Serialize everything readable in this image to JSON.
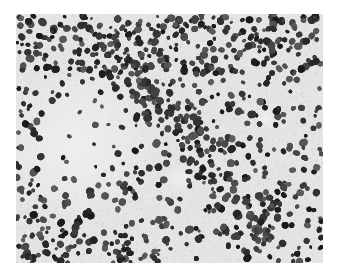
{
  "image": {
    "kind": "grayscale histology micrograph",
    "description": "Tissue section with densely packed dark-stained cell nuclei forming a diagonal band through the center, dense clusters along the bottom edge, a pale sparsely-populated region on the left-middle and a small pale spot at right-center.",
    "colors": {
      "background": "#e4e4e4",
      "pale_region": "#ececec",
      "nuclei": "#2b2b2b"
    },
    "regions": [
      {
        "name": "upper-band",
        "density": "moderate"
      },
      {
        "name": "central-diagonal-band",
        "density": "high"
      },
      {
        "name": "left-pale-region",
        "density": "low"
      },
      {
        "name": "bottom-left-cluster",
        "density": "high"
      },
      {
        "name": "bottom-center-cluster",
        "density": "high"
      },
      {
        "name": "right-area",
        "density": "moderate"
      },
      {
        "name": "right-pale-spot",
        "density": "low"
      }
    ]
  }
}
